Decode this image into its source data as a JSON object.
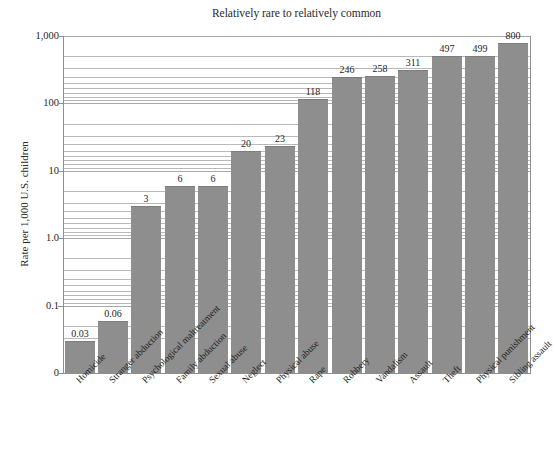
{
  "chart_data": {
    "type": "bar",
    "title": "Relatively rare to relatively common",
    "xlabel": "",
    "ylabel": "Rate per 1,000 U.S. children",
    "yscale": "log",
    "ylim": [
      0.01,
      1000
    ],
    "grid": true,
    "legend": null,
    "y_ticks": [
      {
        "label": "1,000",
        "value": 1000
      },
      {
        "label": "100",
        "value": 100
      },
      {
        "label": "10",
        "value": 10
      },
      {
        "label": "1.0",
        "value": 1
      },
      {
        "label": "0.1",
        "value": 0.1
      },
      {
        "label": "0",
        "value": 0.01
      }
    ],
    "categories": [
      "Homicide",
      "Stranger abduction",
      "Psychological maltreatment",
      "Family abduction",
      "Sexual abuse",
      "Neglect",
      "Physical abuse",
      "Rape",
      "Robbery",
      "Vandalism",
      "Assault",
      "Theft",
      "Physical punishment",
      "Sibling assault"
    ],
    "values": [
      0.03,
      0.06,
      3,
      6,
      6,
      20,
      23,
      118,
      246,
      258,
      311,
      497,
      499,
      800
    ],
    "value_labels": [
      "0.03",
      "0.06",
      "3",
      "6",
      "6",
      "20",
      "23",
      "118",
      "246",
      "258",
      "311",
      "497",
      "499",
      "800"
    ],
    "bar_color": "#8e8e8e",
    "grid_color": "#b9b9b9",
    "text_color": "#1f1f1f"
  }
}
